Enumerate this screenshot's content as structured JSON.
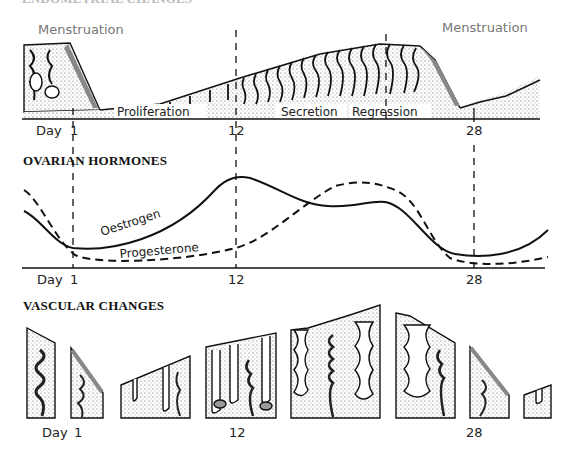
{
  "endometrial": {
    "heading": "ENDOMETRIAL CHANGES",
    "menstruation_left": "Menstruation",
    "menstruation_right": "Menstruation",
    "phases": [
      "Proliferation",
      "Secretion",
      "Regression"
    ],
    "day_labels": {
      "day": "Day",
      "d1": "1",
      "d12": "12",
      "d28": "28"
    }
  },
  "hormones": {
    "heading": "OVARIAN HORMONES",
    "oestrogen_label": "Oestrogen",
    "progesterone_label": "Progesterone",
    "day_labels": {
      "day": "Day",
      "d1": "1",
      "d12": "12",
      "d28": "28"
    }
  },
  "vascular": {
    "heading": "VASCULAR CHANGES",
    "day_labels": {
      "day": "Day",
      "d1": "1",
      "d12": "12",
      "d28": "28"
    }
  },
  "colors": {
    "ink": "#111111",
    "stipple": "#9a9a9a",
    "grey_label": "#777777"
  }
}
